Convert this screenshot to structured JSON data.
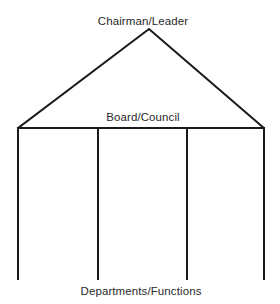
{
  "diagram": {
    "type": "organizational-structure",
    "shape": "house / temple (roof + pillars)",
    "labels": {
      "apex": "Chairman/Leader",
      "crossbeam": "Board/Council",
      "base": "Departments/Functions"
    },
    "roof": {
      "apex": [
        149,
        29
      ],
      "left_corner": [
        18,
        128
      ],
      "right_corner": [
        264,
        128
      ]
    },
    "crossbeam": {
      "y": 128,
      "x_from": 18,
      "x_to": 264
    },
    "pillars": [
      {
        "x": 18,
        "y_top": 128,
        "y_bottom": 279
      },
      {
        "x": 98,
        "y_top": 128,
        "y_bottom": 279
      },
      {
        "x": 187,
        "y_top": 128,
        "y_bottom": 279
      },
      {
        "x": 264,
        "y_top": 128,
        "y_bottom": 279
      }
    ],
    "colors": {
      "line": "#1a1a1a",
      "text": "#2a2a2a",
      "background": "#ffffff"
    }
  }
}
